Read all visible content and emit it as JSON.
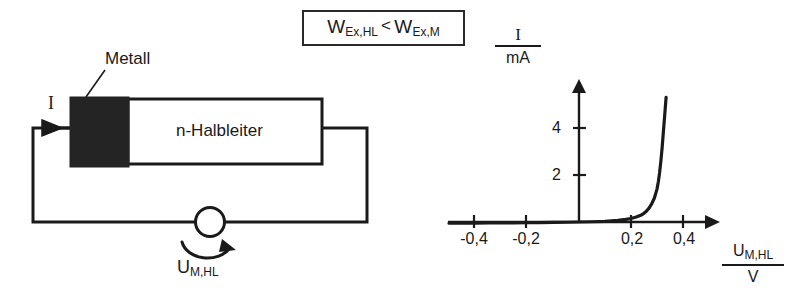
{
  "figure": {
    "condition_box": {
      "left_symbol": "W",
      "left_subscript": "Ex,HL",
      "relation": "<",
      "right_symbol": "W",
      "right_subscript": "Ex,M",
      "full_text": "W_Ex,HL < W_Ex,M"
    },
    "circuit": {
      "metal_label": "Metall",
      "semiconductor_label": "n-Halbleiter",
      "current_label": "I",
      "source_symbol": "U",
      "source_subscript": "M,HL",
      "source_label_full": "U_M,HL"
    },
    "colors": {
      "line": "#1a1a1a",
      "metal_fill": "#242424",
      "semiconductor_fill": "#ffffff",
      "background": "#ffffff"
    }
  },
  "chart_data": {
    "type": "line",
    "title": "",
    "xlabel_numerator": "U",
    "xlabel_numerator_sub": "M,HL",
    "xlabel_denominator": "V",
    "ylabel_numerator": "I",
    "ylabel_denominator": "mA",
    "xlim": [
      -0.5,
      0.52
    ],
    "ylim": [
      -0.3,
      5.6
    ],
    "xticks": [
      -0.4,
      -0.2,
      0.2,
      0.4
    ],
    "xtick_labels": [
      "-0,4",
      "-0,2",
      "0,2",
      "0,4"
    ],
    "yticks": [
      2,
      4
    ],
    "ytick_labels": [
      "2",
      "4"
    ],
    "grid": false,
    "legend": null,
    "series": [
      {
        "name": "Schottky-Diode Kennlinie",
        "x": [
          -0.5,
          -0.45,
          -0.4,
          -0.35,
          -0.3,
          -0.25,
          -0.2,
          -0.15,
          -0.1,
          -0.05,
          0.0,
          0.05,
          0.1,
          0.15,
          0.18,
          0.2,
          0.22,
          0.24,
          0.25,
          0.26,
          0.27,
          0.28,
          0.29,
          0.3,
          0.305,
          0.31,
          0.315,
          0.32,
          0.325,
          0.33,
          0.335
        ],
        "y": [
          -0.05,
          -0.05,
          -0.05,
          -0.04,
          -0.04,
          -0.04,
          -0.03,
          -0.03,
          -0.02,
          -0.01,
          0.0,
          0.01,
          0.03,
          0.07,
          0.11,
          0.15,
          0.21,
          0.3,
          0.37,
          0.47,
          0.6,
          0.78,
          1.02,
          1.4,
          1.7,
          2.1,
          2.6,
          3.2,
          3.9,
          4.6,
          5.3
        ]
      }
    ]
  }
}
